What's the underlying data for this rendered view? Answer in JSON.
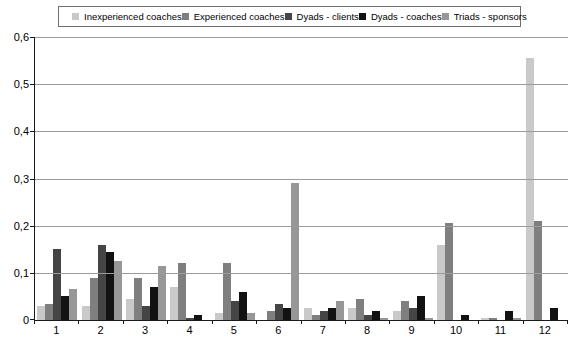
{
  "chart_data": {
    "type": "bar",
    "title": "",
    "xlabel": "",
    "ylabel": "",
    "ylim": [
      0,
      0.6
    ],
    "ytick_step": 0.1,
    "ytick_labels": [
      "0",
      "0,1",
      "0,2",
      "0,3",
      "0,4",
      "0,5",
      "0,6"
    ],
    "grid": true,
    "legend_position": "top",
    "categories": [
      "1",
      "2",
      "3",
      "4",
      "5",
      "6",
      "7",
      "8",
      "9",
      "10",
      "11",
      "12"
    ],
    "series": [
      {
        "name": "Inexperienced coaches",
        "color": "#c9c9c9",
        "values": [
          0.03,
          0.03,
          0.045,
          0.07,
          0.015,
          0,
          0.025,
          0.025,
          0.02,
          0.16,
          0.005,
          0.555
        ]
      },
      {
        "name": "Experienced coaches",
        "color": "#7f7f7f",
        "values": [
          0.035,
          0.09,
          0.09,
          0.12,
          0.12,
          0.02,
          0.01,
          0.045,
          0.04,
          0.205,
          0.005,
          0.21
        ]
      },
      {
        "name": "Dyads - clients",
        "color": "#454545",
        "values": [
          0.15,
          0.16,
          0.03,
          0.005,
          0.04,
          0.035,
          0.02,
          0.01,
          0.025,
          0,
          0,
          0
        ]
      },
      {
        "name": "Dyads - coaches",
        "color": "#121212",
        "values": [
          0.05,
          0.145,
          0.07,
          0.01,
          0.06,
          0.025,
          0.025,
          0.02,
          0.05,
          0.01,
          0.02,
          0.025
        ]
      },
      {
        "name": "Triads - sponsors",
        "color": "#979797",
        "values": [
          0.065,
          0.125,
          0.115,
          0,
          0.015,
          0.29,
          0.04,
          0.005,
          0.005,
          0,
          0.005,
          0
        ]
      }
    ]
  }
}
